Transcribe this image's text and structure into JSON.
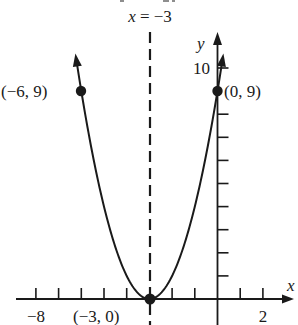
{
  "chart_data": {
    "type": "line",
    "title": "",
    "function": "y = (x + 3)^2",
    "xlabel": "x",
    "ylabel": "y",
    "xlim": [
      -8.1,
      3.2
    ],
    "ylim": [
      0,
      11.5
    ],
    "x_tick_step": 1,
    "y_tick_step": 1,
    "x_tick_labels": [
      {
        "value": -8,
        "label": "−8"
      },
      {
        "value": 2,
        "label": "2"
      }
    ],
    "y_tick_labels": [
      {
        "value": 10,
        "label": "10"
      }
    ],
    "grid": false,
    "axis_of_symmetry": {
      "x": -3,
      "label": "x = −3",
      "style": "dashed"
    },
    "points": [
      {
        "x": -6,
        "y": 9,
        "label": "(−6, 9)"
      },
      {
        "x": -3,
        "y": 0,
        "label": "(−3, 0)"
      },
      {
        "x": 0,
        "y": 9,
        "label": "(0, 9)"
      }
    ],
    "series": [
      {
        "name": "parabola",
        "x": [
          -6.3,
          -6,
          -5,
          -4,
          -3,
          -2,
          -1,
          0,
          0.3
        ],
        "values": [
          10.89,
          9,
          4,
          1,
          0,
          1,
          4,
          9,
          10.89
        ]
      }
    ]
  },
  "labels": {
    "axis_eq": "x = −3",
    "x_axis": "x",
    "y_axis": "y",
    "y_ten": "10",
    "x_neg8": "−8",
    "x_two": "2",
    "pt_left": "(−6, 9)",
    "pt_vertex": "(−3, 0)",
    "pt_right": "(0, 9)"
  }
}
